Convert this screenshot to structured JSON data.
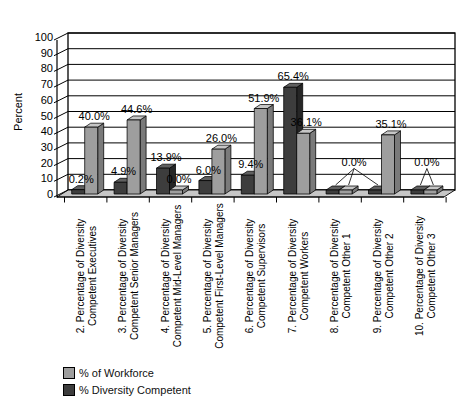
{
  "chart_data": {
    "type": "bar",
    "style": "3d-clustered-column",
    "title": "",
    "xlabel": "",
    "ylabel": "Percent",
    "ylim": [
      0,
      100
    ],
    "ytick_step": 10,
    "yticks": [
      0,
      10,
      20,
      30,
      40,
      50,
      60,
      70,
      80,
      90,
      100
    ],
    "grid": "horizontal",
    "legend_position": "bottom-left",
    "categories": [
      [
        "2. Percentage of Diversity",
        "Competent Executives"
      ],
      [
        "3. Percentage of Diversity",
        "Competent Senior Managers"
      ],
      [
        "4. Percentage of Diversity",
        "Competent Mid-Level Managers"
      ],
      [
        "5. Percentage of Diversity",
        "Competent First-Level Managers"
      ],
      [
        "6. Percentage of Diversity",
        "Competent Supervisors"
      ],
      [
        "7. Percentage of Diversity",
        "Competent Workers"
      ],
      [
        "8. Percentage of Diversity",
        "Competent Other 1"
      ],
      [
        "9. Percentage of Diversity",
        "Competent Other 2"
      ],
      [
        "10. Percentage of Diversity",
        "Competent Other 3"
      ]
    ],
    "series": [
      {
        "name": "% Diversity Competent",
        "color": "#3d3d3d",
        "faces": {
          "front": "#3d3d3d",
          "top": "#606060",
          "side": "#262626"
        },
        "values": [
          0.2,
          4.9,
          13.9,
          6.0,
          9.4,
          65.4,
          0.0,
          0.0,
          0.0
        ],
        "labels": [
          "0.2%",
          "4.9%",
          "13.9%",
          "6.0%",
          "9.4%",
          "65.4%",
          null,
          null,
          null
        ]
      },
      {
        "name": "% of Workforce",
        "color": "#9e9e9e",
        "faces": {
          "front": "#9e9e9e",
          "top": "#c6c6c6",
          "side": "#7a7a7a"
        },
        "values": [
          40.0,
          44.6,
          0.0,
          26.0,
          51.9,
          36.1,
          0.0,
          35.1,
          0.0
        ],
        "labels": [
          "40.0%",
          "44.6%",
          "0.0%",
          "26.0%",
          "51.9%",
          "36.1%",
          null,
          "35.1%",
          null
        ]
      }
    ],
    "legend": [
      {
        "label": "% of Workforce",
        "color": "#9e9e9e"
      },
      {
        "label": "% Diversity Competent",
        "color": "#3d3d3d"
      }
    ],
    "zero_callouts": [
      {
        "text": "0.0%",
        "bars": [
          [
            0,
            6
          ],
          [
            1,
            6
          ],
          [
            0,
            7
          ]
        ]
      },
      {
        "text": "0.0%",
        "bars": [
          [
            0,
            8
          ],
          [
            1,
            8
          ]
        ]
      }
    ],
    "floor_color": "#c6c6c6",
    "wall_color": "#ffffff",
    "line_color": "#000000"
  }
}
